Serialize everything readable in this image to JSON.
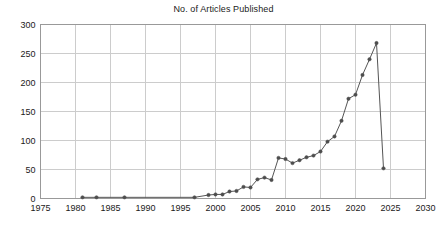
{
  "chart_data": {
    "type": "line",
    "title": "No. of Articles Published",
    "xlabel": "",
    "ylabel": "",
    "xlim": [
      1975,
      2030
    ],
    "ylim": [
      0,
      300
    ],
    "xticks": [
      1975,
      1980,
      1985,
      1990,
      1995,
      2000,
      2005,
      2010,
      2015,
      2020,
      2025,
      2030
    ],
    "yticks": [
      0,
      50,
      100,
      150,
      200,
      250,
      300
    ],
    "grid": true,
    "legend": "none",
    "marker": "filled-circle",
    "line_color": "#555555",
    "marker_color": "#4d4d4d",
    "grid_color": "#cccccc",
    "frame_color": "#999999",
    "x": [
      1981,
      1983,
      1987,
      1997,
      1999,
      2000,
      2001,
      2002,
      2003,
      2004,
      2005,
      2006,
      2007,
      2008,
      2009,
      2010,
      2011,
      2012,
      2013,
      2014,
      2015,
      2016,
      2017,
      2018,
      2019,
      2020,
      2021,
      2022,
      2023,
      2024
    ],
    "values": [
      2,
      2,
      2,
      2,
      6,
      7,
      7,
      12,
      13,
      20,
      19,
      33,
      36,
      32,
      70,
      68,
      61,
      66,
      71,
      74,
      81,
      98,
      107,
      134,
      172,
      179,
      213,
      240,
      268,
      52
    ],
    "series": [
      {
        "name": "No. of Articles Published",
        "points": [
          {
            "x": 1981,
            "y": 2
          },
          {
            "x": 1983,
            "y": 2
          },
          {
            "x": 1987,
            "y": 2
          },
          {
            "x": 1997,
            "y": 2
          },
          {
            "x": 1999,
            "y": 6
          },
          {
            "x": 2000,
            "y": 7
          },
          {
            "x": 2001,
            "y": 7
          },
          {
            "x": 2002,
            "y": 12
          },
          {
            "x": 2003,
            "y": 13
          },
          {
            "x": 2004,
            "y": 20
          },
          {
            "x": 2005,
            "y": 19
          },
          {
            "x": 2006,
            "y": 33
          },
          {
            "x": 2007,
            "y": 36
          },
          {
            "x": 2008,
            "y": 32
          },
          {
            "x": 2009,
            "y": 70
          },
          {
            "x": 2010,
            "y": 68
          },
          {
            "x": 2011,
            "y": 61
          },
          {
            "x": 2012,
            "y": 66
          },
          {
            "x": 2013,
            "y": 71
          },
          {
            "x": 2014,
            "y": 74
          },
          {
            "x": 2015,
            "y": 81
          },
          {
            "x": 2016,
            "y": 98
          },
          {
            "x": 2017,
            "y": 107
          },
          {
            "x": 2018,
            "y": 134
          },
          {
            "x": 2019,
            "y": 172
          },
          {
            "x": 2020,
            "y": 179
          },
          {
            "x": 2021,
            "y": 213
          },
          {
            "x": 2022,
            "y": 240
          },
          {
            "x": 2023,
            "y": 268
          },
          {
            "x": 2024,
            "y": 52
          }
        ]
      }
    ]
  }
}
